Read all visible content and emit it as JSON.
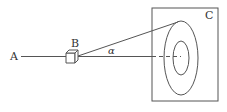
{
  "diagram": {
    "labels": {
      "a": "A",
      "b": "B",
      "c": "C",
      "angle": "α"
    },
    "colors": {
      "stroke": "#555555",
      "text": "#333333",
      "background": "#ffffff"
    },
    "elements": [
      "light-source-point-A",
      "cube-B",
      "screen-C",
      "outer-ring",
      "inner-ring",
      "axis-line",
      "cone-edge-line",
      "angle-alpha"
    ]
  }
}
